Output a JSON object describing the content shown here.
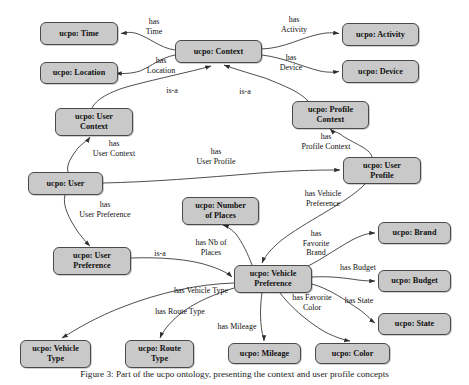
{
  "diagram": {
    "node_fill": "#c9c9c9",
    "node_stroke": "#4a4a4a",
    "edge_stroke": "#3a3a3a",
    "background": "#ffffff",
    "nodes": [
      {
        "id": "time",
        "label": "ucpo: Time",
        "x": 40,
        "y": 22,
        "w": 78,
        "h": 23
      },
      {
        "id": "context",
        "label": "ucpo: Context",
        "x": 175,
        "y": 40,
        "w": 87,
        "h": 23
      },
      {
        "id": "activity",
        "label": "ucpo: Activity",
        "x": 342,
        "y": 23,
        "w": 77,
        "h": 23
      },
      {
        "id": "location",
        "label": "ucpo: Location",
        "x": 40,
        "y": 62,
        "w": 78,
        "h": 22
      },
      {
        "id": "device",
        "label": "ucpo: Device",
        "x": 342,
        "y": 60,
        "w": 77,
        "h": 23
      },
      {
        "id": "usercontext",
        "label": "ucpo: User\nContext",
        "x": 55,
        "y": 108,
        "w": 78,
        "h": 28
      },
      {
        "id": "profilectx",
        "label": "ucpo: Profile\nContext",
        "x": 292,
        "y": 101,
        "w": 77,
        "h": 28
      },
      {
        "id": "userprofile",
        "label": "ucpo: User\nProfile",
        "x": 343,
        "y": 157,
        "w": 78,
        "h": 27
      },
      {
        "id": "user",
        "label": "ucpo: User",
        "x": 28,
        "y": 172,
        "w": 75,
        "h": 23
      },
      {
        "id": "numplaces",
        "label": "ucpo: Number\nof Places",
        "x": 182,
        "y": 197,
        "w": 77,
        "h": 28
      },
      {
        "id": "brand",
        "label": "ucpo: Brand",
        "x": 378,
        "y": 222,
        "w": 73,
        "h": 22
      },
      {
        "id": "userpref",
        "label": "ucpo: User\nPreference",
        "x": 53,
        "y": 247,
        "w": 78,
        "h": 28
      },
      {
        "id": "budget",
        "label": "ucpo: Budget",
        "x": 378,
        "y": 270,
        "w": 73,
        "h": 22
      },
      {
        "id": "vehpref",
        "label": "ucpo: Vehicle\nPreference",
        "x": 234,
        "y": 265,
        "w": 78,
        "h": 28
      },
      {
        "id": "state",
        "label": "ucpo: State",
        "x": 378,
        "y": 313,
        "w": 73,
        "h": 22
      },
      {
        "id": "vehtype",
        "label": "ucpo: Vehicle\nType",
        "x": 20,
        "y": 340,
        "w": 71,
        "h": 28
      },
      {
        "id": "routetype",
        "label": "ucpo: Route\nType",
        "x": 125,
        "y": 340,
        "w": 69,
        "h": 28
      },
      {
        "id": "mileage",
        "label": "ucpo: Mileage",
        "x": 228,
        "y": 343,
        "w": 73,
        "h": 21
      },
      {
        "id": "color",
        "label": "ucpo: Color",
        "x": 315,
        "y": 343,
        "w": 75,
        "h": 21
      }
    ],
    "edges": [
      {
        "id": "e-has-time",
        "label": "has\nTime",
        "from": "context",
        "to": "time",
        "label_x": 154,
        "label_y": 27
      },
      {
        "id": "e-has-activity",
        "label": "has\nActivity",
        "from": "context",
        "to": "activity",
        "label_x": 294,
        "label_y": 25
      },
      {
        "id": "e-has-location",
        "label": "has\nLocation",
        "from": "context",
        "to": "location",
        "label_x": 161,
        "label_y": 66
      },
      {
        "id": "e-has-device",
        "label": "has\nDevice",
        "from": "context",
        "to": "device",
        "label_x": 291,
        "label_y": 63
      },
      {
        "id": "e-isa-usercontext",
        "label": "is-a",
        "from": "usercontext",
        "to": "context",
        "label_x": 172,
        "label_y": 91
      },
      {
        "id": "e-isa-profilecontext",
        "label": "is-a",
        "from": "profilectx",
        "to": "context",
        "label_x": 245,
        "label_y": 92
      },
      {
        "id": "e-has-usercontext",
        "label": "has\nUser Context",
        "from": "user",
        "to": "usercontext",
        "label_x": 114,
        "label_y": 149
      },
      {
        "id": "e-has-userprofile",
        "label": "has\nUser Profile",
        "from": "user",
        "to": "userprofile",
        "label_x": 216,
        "label_y": 157
      },
      {
        "id": "e-has-profilecontext",
        "label": "has\nProfile Context",
        "from": "userprofile",
        "to": "profilectx",
        "label_x": 326,
        "label_y": 142
      },
      {
        "id": "e-has-userpreference",
        "label": "has\nUser Preference",
        "from": "user",
        "to": "userpref",
        "label_x": 105,
        "label_y": 210
      },
      {
        "id": "e-has-vehiclepref",
        "label": "has Vehicle\nPreference",
        "from": "userprofile",
        "to": "vehpref",
        "label_x": 323,
        "label_y": 199
      },
      {
        "id": "e-isa-userpref",
        "label": "is-a",
        "from": "userpref",
        "to": "vehpref",
        "label_x": 160,
        "label_y": 254
      },
      {
        "id": "e-has-nbplaces",
        "label": "has Nb of\nPlaces",
        "from": "vehpref",
        "to": "numplaces",
        "label_x": 211,
        "label_y": 248
      },
      {
        "id": "e-has-favoritebrand",
        "label": "has\nFavorite\nBrand",
        "from": "vehpref",
        "to": "brand",
        "label_x": 316,
        "label_y": 243
      },
      {
        "id": "e-has-budget",
        "label": "has Budget",
        "from": "vehpref",
        "to": "budget",
        "label_x": 358,
        "label_y": 268
      },
      {
        "id": "e-has-state",
        "label": "has State",
        "from": "vehpref",
        "to": "state",
        "label_x": 359,
        "label_y": 301
      },
      {
        "id": "e-has-vehicletype",
        "label": "has Vehicle Type",
        "from": "vehpref",
        "to": "vehtype",
        "label_x": 201,
        "label_y": 291
      },
      {
        "id": "e-has-routetype",
        "label": "has Route Type",
        "from": "vehpref",
        "to": "routetype",
        "label_x": 180,
        "label_y": 312
      },
      {
        "id": "e-has-mileage",
        "label": "has Mileage",
        "from": "vehpref",
        "to": "mileage",
        "label_x": 237,
        "label_y": 327
      },
      {
        "id": "e-has-favoritecolor",
        "label": "has Favorite\nColor",
        "from": "vehpref",
        "to": "color",
        "label_x": 312,
        "label_y": 303
      }
    ],
    "caption": "Figure 3: Part of the ucpo ontology, presenting the context and user profile concepts"
  }
}
